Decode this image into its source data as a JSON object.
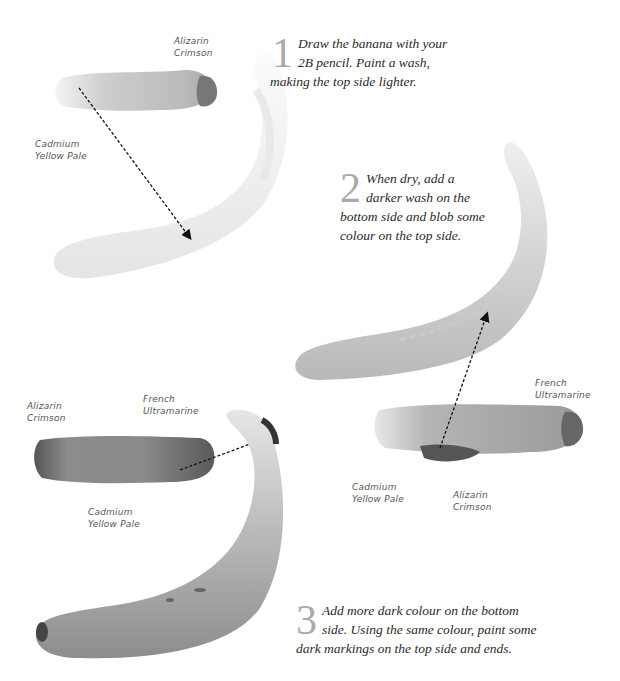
{
  "steps": [
    {
      "number": "1",
      "line1": "Draw the banana with your",
      "line2": "2B pencil. Paint a wash,",
      "line3": "making the top side lighter."
    },
    {
      "number": "2",
      "line1": "When dry, add a",
      "line2": "darker wash on the",
      "line3": "bottom side and blob some",
      "line4": "colour on the top side."
    },
    {
      "number": "3",
      "line1": "Add more dark colour on the bottom",
      "line2": "side. Using the same colour, paint some",
      "line3": "dark markings on the top side and ends."
    }
  ],
  "labels": {
    "step1": {
      "alizarin": [
        "Alizarin",
        "Crimson"
      ],
      "cadmium": [
        "Cadmium",
        "Yellow Pale"
      ]
    },
    "step2": {
      "french": [
        "French",
        "Ultramarine"
      ],
      "cadmium": [
        "Cadmium",
        "Yellow Pale"
      ],
      "alizarin": [
        "Alizarin",
        "Crimson"
      ]
    },
    "step3": {
      "alizarin": [
        "Alizarin",
        "Crimson"
      ],
      "french": [
        "French",
        "Ultramarine"
      ],
      "cadmium": [
        "Cadmium",
        "Yellow Pale"
      ]
    }
  },
  "colors": {
    "background": "#ffffff",
    "text": "#2a2a2a",
    "step_number": "#a9a9a9",
    "label": "#555555"
  }
}
